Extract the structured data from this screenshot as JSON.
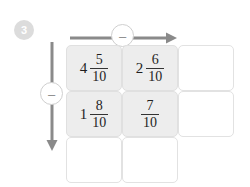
{
  "step": {
    "number": "3"
  },
  "operations": {
    "horizontal": {
      "symbol": "–",
      "icon": "minus-icon",
      "direction": "right"
    },
    "vertical": {
      "symbol": "–",
      "icon": "minus-icon",
      "direction": "down"
    }
  },
  "colors": {
    "filled_cell": "#ededed",
    "empty_cell": "#ffffff",
    "cell_border": "#e2e2e2",
    "arrow": "#8a8a8a",
    "badge": "#dcdcdc",
    "text": "#1f1f1f"
  },
  "grid": {
    "rows": 3,
    "columns": 3,
    "cells": [
      [
        {
          "filled": true,
          "whole": "4",
          "numerator": "5",
          "denominator": "10",
          "empty": false,
          "rendered": true
        },
        {
          "filled": true,
          "whole": "2",
          "numerator": "6",
          "denominator": "10",
          "empty": false,
          "rendered": true
        },
        {
          "filled": false,
          "whole": "",
          "numerator": "",
          "denominator": "",
          "empty": true,
          "rendered": true
        }
      ],
      [
        {
          "filled": true,
          "whole": "1",
          "numerator": "8",
          "denominator": "10",
          "empty": false,
          "rendered": true
        },
        {
          "filled": true,
          "whole": "",
          "numerator": "7",
          "denominator": "10",
          "empty": false,
          "rendered": true
        },
        {
          "filled": false,
          "whole": "",
          "numerator": "",
          "denominator": "",
          "empty": true,
          "rendered": true
        }
      ],
      [
        {
          "filled": false,
          "whole": "",
          "numerator": "",
          "denominator": "",
          "empty": true,
          "rendered": true
        },
        {
          "filled": false,
          "whole": "",
          "numerator": "",
          "denominator": "",
          "empty": true,
          "rendered": true
        },
        {
          "filled": false,
          "whole": "",
          "numerator": "",
          "denominator": "",
          "empty": true,
          "rendered": false
        }
      ]
    ]
  }
}
